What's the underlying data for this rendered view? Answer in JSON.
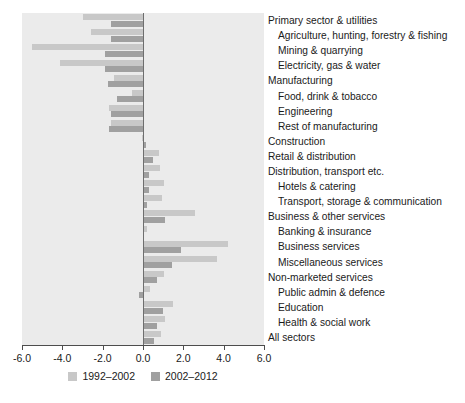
{
  "chart_data": {
    "type": "bar",
    "orientation": "horizontal",
    "title": "",
    "xlabel": "",
    "ylabel": "",
    "xlim": [
      -6.0,
      6.0
    ],
    "grid": false,
    "legend_position": "bottom",
    "axis_ticks": [
      "-6.0",
      "-4.0",
      "-2.0",
      "0.0",
      "2.0",
      "4.0",
      "6.0"
    ],
    "axis_tick_values": [
      -6.0,
      -4.0,
      -2.0,
      0.0,
      2.0,
      4.0,
      6.0
    ],
    "categories": [
      "Primary sector & utilities",
      "Agriculture, hunting, forestry & fishing",
      "Mining & quarrying",
      "Electricity, gas & water",
      "Manufacturing",
      "Food, drink & tobacco",
      "Engineering",
      "Rest of manufacturing",
      "Construction",
      "Retail & distribution",
      "Distribution, transport etc.",
      "Hotels & catering",
      "Transport, storage & communication",
      "Business & other services",
      "Banking & insurance",
      "Business services",
      "Miscellaneous services",
      "Non-marketed services",
      "Public admin & defence",
      "Education",
      "Health & social work",
      "All sectors"
    ],
    "category_indent": [
      false,
      true,
      true,
      true,
      false,
      true,
      true,
      true,
      false,
      false,
      false,
      true,
      true,
      false,
      true,
      true,
      true,
      false,
      true,
      true,
      true,
      false
    ],
    "series": [
      {
        "name": "1992–2002",
        "color": "#c8c8c8",
        "values": [
          -3.0,
          -2.6,
          -5.5,
          -4.1,
          -1.45,
          -0.55,
          -1.7,
          -1.6,
          -0.05,
          0.8,
          0.85,
          1.05,
          0.95,
          2.6,
          0.2,
          4.2,
          3.65,
          1.05,
          0.35,
          1.5,
          1.1,
          0.9
        ]
      },
      {
        "name": "2002–2012",
        "color": "#a0a0a0",
        "values": [
          -1.6,
          -1.6,
          -1.9,
          -1.9,
          -1.75,
          -1.3,
          -1.6,
          -1.7,
          0.15,
          0.5,
          0.3,
          0.3,
          0.2,
          1.1,
          0.05,
          1.9,
          1.45,
          0.7,
          -0.2,
          1.0,
          0.7,
          0.55
        ]
      }
    ]
  },
  "legend": {
    "items": [
      {
        "label": "1992–2002",
        "swatch": "light"
      },
      {
        "label": "2002–2012",
        "swatch": "dark"
      }
    ]
  },
  "colors": {
    "panel_background": "#ebebeb",
    "series_1992_2002": "#c8c8c8",
    "series_2002_2012": "#a0a0a0",
    "zero_line": "#6e6e6e",
    "axis": "#4d4d4d",
    "text": "#1a1a1a"
  }
}
